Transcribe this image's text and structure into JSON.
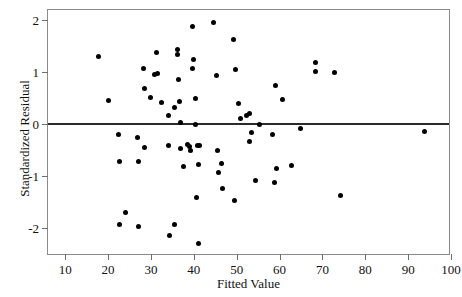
{
  "chart_data": {
    "type": "scatter",
    "title": "",
    "xlabel": "Fitted Value",
    "ylabel": "Standardized Residual",
    "xlim": [
      6,
      100
    ],
    "ylim": [
      -2.55,
      2.2
    ],
    "xticks": [
      10,
      20,
      30,
      40,
      50,
      60,
      70,
      80,
      90,
      100
    ],
    "yticks": [
      -2,
      -1,
      0,
      2,
      1
    ],
    "ytick_labels": [
      "2",
      "1",
      "0",
      "-1",
      "-2"
    ],
    "xtick_labels": [
      "10",
      "20",
      "30",
      "40",
      "50",
      "60",
      "70",
      "80",
      "90",
      "100"
    ],
    "grid": false,
    "legend": null,
    "reference_line": {
      "orientation": "horizontal",
      "y": 0,
      "color": "#2b2b2b"
    },
    "marker": {
      "shape": "circle",
      "color": "#000000",
      "size": 5
    },
    "points": [
      {
        "x": 17.8,
        "y": 1.31
      },
      {
        "x": 20.0,
        "y": 0.46
      },
      {
        "x": 22.4,
        "y": -0.21
      },
      {
        "x": 22.6,
        "y": -0.72
      },
      {
        "x": 22.6,
        "y": -1.95
      },
      {
        "x": 24.0,
        "y": -1.71
      },
      {
        "x": 26.9,
        "y": -0.26
      },
      {
        "x": 27.0,
        "y": -0.73
      },
      {
        "x": 27.2,
        "y": -1.99
      },
      {
        "x": 28.3,
        "y": 1.08
      },
      {
        "x": 28.5,
        "y": 0.69
      },
      {
        "x": 28.6,
        "y": -0.46
      },
      {
        "x": 29.8,
        "y": 0.52
      },
      {
        "x": 30.8,
        "y": 0.96
      },
      {
        "x": 31.3,
        "y": 1.38
      },
      {
        "x": 31.6,
        "y": 0.97
      },
      {
        "x": 32.4,
        "y": 0.41
      },
      {
        "x": 34.0,
        "y": -0.42
      },
      {
        "x": 34.2,
        "y": 0.16
      },
      {
        "x": 34.4,
        "y": -2.16
      },
      {
        "x": 35.4,
        "y": -1.95
      },
      {
        "x": 35.6,
        "y": 0.32
      },
      {
        "x": 36.2,
        "y": 1.44
      },
      {
        "x": 36.3,
        "y": 1.35
      },
      {
        "x": 36.5,
        "y": 0.85
      },
      {
        "x": 36.7,
        "y": 0.44
      },
      {
        "x": 36.8,
        "y": 0.02
      },
      {
        "x": 36.9,
        "y": -0.47
      },
      {
        "x": 37.6,
        "y": -0.83
      },
      {
        "x": 38.6,
        "y": -0.39
      },
      {
        "x": 39.0,
        "y": -0.44
      },
      {
        "x": 39.3,
        "y": -0.52
      },
      {
        "x": 39.6,
        "y": 1.08
      },
      {
        "x": 39.8,
        "y": 1.88
      },
      {
        "x": 40.0,
        "y": 1.25
      },
      {
        "x": 40.3,
        "y": 0.49
      },
      {
        "x": 40.5,
        "y": -0.02
      },
      {
        "x": 40.7,
        "y": -1.42
      },
      {
        "x": 40.9,
        "y": -0.42
      },
      {
        "x": 41.0,
        "y": -2.31
      },
      {
        "x": 41.2,
        "y": -0.79
      },
      {
        "x": 41.4,
        "y": -0.41
      },
      {
        "x": 44.5,
        "y": 1.95
      },
      {
        "x": 45.2,
        "y": 0.93
      },
      {
        "x": 45.5,
        "y": -0.51
      },
      {
        "x": 45.7,
        "y": -0.94
      },
      {
        "x": 46.4,
        "y": -0.76
      },
      {
        "x": 46.6,
        "y": -1.24
      },
      {
        "x": 49.3,
        "y": 1.63
      },
      {
        "x": 49.5,
        "y": -1.48
      },
      {
        "x": 49.8,
        "y": 1.06
      },
      {
        "x": 50.5,
        "y": 0.39
      },
      {
        "x": 50.8,
        "y": 0.1
      },
      {
        "x": 52.3,
        "y": 0.16
      },
      {
        "x": 53.0,
        "y": 0.21
      },
      {
        "x": 53.1,
        "y": -0.33
      },
      {
        "x": 53.4,
        "y": -0.17
      },
      {
        "x": 54.3,
        "y": -1.1
      },
      {
        "x": 55.3,
        "y": -0.02
      },
      {
        "x": 58.4,
        "y": -0.21
      },
      {
        "x": 58.8,
        "y": -1.13
      },
      {
        "x": 59.1,
        "y": 0.75
      },
      {
        "x": 59.4,
        "y": -0.87
      },
      {
        "x": 60.7,
        "y": 0.47
      },
      {
        "x": 62.9,
        "y": -0.81
      },
      {
        "x": 64.9,
        "y": -0.09
      },
      {
        "x": 68.3,
        "y": 1.18
      },
      {
        "x": 68.5,
        "y": 1.02
      },
      {
        "x": 72.9,
        "y": 0.99
      },
      {
        "x": 74.3,
        "y": -1.39
      },
      {
        "x": 93.8,
        "y": -0.14
      }
    ]
  },
  "axes": {
    "x_title": "Fitted Value",
    "y_title": "Standardized Residual"
  }
}
